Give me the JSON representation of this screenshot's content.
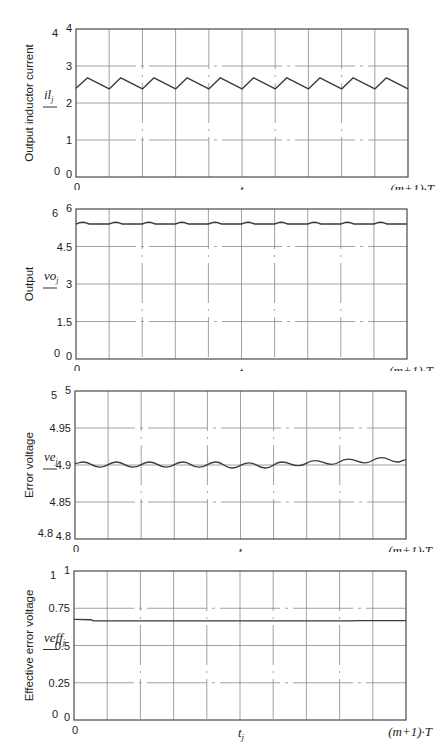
{
  "chart_data": [
    {
      "type": "line",
      "title": "",
      "ylabel": "Output inductor current",
      "var_label": "il_j",
      "var_base": "il",
      "var_sub": "j",
      "xlabel": "t_j",
      "x_ticks": [
        "0",
        "(m+1)·T"
      ],
      "x_divisions": 10,
      "ylim": [
        0,
        4
      ],
      "y_ticks": [
        0,
        1,
        2,
        3,
        4
      ],
      "y_tick_labels": [
        "0",
        "1",
        "2",
        "3",
        "4"
      ],
      "outer_labels": {
        "top": "4",
        "bottom": "0"
      },
      "grid": true,
      "series": [
        {
          "name": "il_j",
          "x": [
            0,
            0.35,
            1,
            1.35,
            2,
            2.35,
            3,
            3.35,
            4,
            4.35,
            5,
            5.35,
            6,
            6.35,
            7,
            7.35,
            8,
            8.35,
            9,
            9.35,
            10
          ],
          "values": [
            2.4,
            2.68,
            2.38,
            2.68,
            2.38,
            2.68,
            2.38,
            2.68,
            2.38,
            2.68,
            2.38,
            2.68,
            2.38,
            2.68,
            2.38,
            2.68,
            2.38,
            2.68,
            2.38,
            2.68,
            2.38
          ]
        }
      ]
    },
    {
      "type": "line",
      "title": "",
      "ylabel": "Output",
      "var_label": "vo_j",
      "var_base": "vo",
      "var_sub": "j",
      "xlabel": "t_j",
      "x_ticks": [
        "0",
        "(m+1)·T"
      ],
      "x_divisions": 10,
      "ylim": [
        0,
        6
      ],
      "y_ticks": [
        0,
        1.5,
        3,
        4.5,
        6
      ],
      "y_tick_labels": [
        "0",
        "1.5",
        "3",
        "4.5",
        "6"
      ],
      "outer_labels": {
        "top": "6",
        "bottom": "0"
      },
      "grid": true,
      "series": [
        {
          "name": "vo_j",
          "x": [
            0,
            0.1,
            0.2,
            0.3,
            0.4,
            1,
            1.1,
            1.2,
            1.3,
            1.4,
            2,
            2.1,
            2.2,
            2.3,
            2.4,
            3,
            3.1,
            3.2,
            3.3,
            3.4,
            4,
            4.1,
            4.2,
            4.3,
            4.4,
            5,
            5.1,
            5.2,
            5.3,
            5.4,
            6,
            6.1,
            6.2,
            6.3,
            6.4,
            7,
            7.1,
            7.2,
            7.3,
            7.4,
            8,
            8.1,
            8.2,
            8.3,
            8.4,
            9,
            9.1,
            9.2,
            9.3,
            9.4,
            10
          ],
          "values": [
            5.4,
            5.45,
            5.47,
            5.45,
            5.4,
            5.4,
            5.45,
            5.47,
            5.45,
            5.4,
            5.4,
            5.45,
            5.47,
            5.45,
            5.4,
            5.4,
            5.45,
            5.47,
            5.45,
            5.4,
            5.4,
            5.45,
            5.47,
            5.45,
            5.4,
            5.4,
            5.45,
            5.47,
            5.45,
            5.4,
            5.4,
            5.45,
            5.47,
            5.45,
            5.4,
            5.4,
            5.45,
            5.47,
            5.45,
            5.4,
            5.4,
            5.45,
            5.47,
            5.45,
            5.4,
            5.4,
            5.45,
            5.47,
            5.45,
            5.4,
            5.4
          ]
        }
      ]
    },
    {
      "type": "line",
      "title": "",
      "ylabel": "Error voltage",
      "var_label": "ve_j",
      "var_base": "ve",
      "var_sub": "j",
      "xlabel": "t_j",
      "x_ticks": [
        "0",
        "(m+1)·T"
      ],
      "x_divisions": 10,
      "ylim": [
        4.8,
        5.0
      ],
      "y_ticks": [
        4.8,
        4.85,
        4.9,
        4.95,
        5.0
      ],
      "y_tick_labels": [
        "4.8",
        "4.85",
        "4.9",
        "4.95",
        "5"
      ],
      "outer_labels": {
        "top": "5",
        "bottom": "4.8"
      },
      "grid": true,
      "series": [
        {
          "name": "ve_j",
          "x": [
            0,
            0.25,
            0.75,
            1.25,
            1.75,
            2.25,
            2.75,
            3.25,
            3.75,
            4.25,
            4.75,
            5.25,
            5.75,
            6.25,
            6.75,
            7.25,
            7.75,
            8.25,
            8.75,
            9.25,
            9.75,
            10
          ],
          "values": [
            4.902,
            4.904,
            4.897,
            4.904,
            4.897,
            4.904,
            4.897,
            4.904,
            4.897,
            4.904,
            4.896,
            4.903,
            4.896,
            4.904,
            4.899,
            4.906,
            4.901,
            4.908,
            4.903,
            4.91,
            4.904,
            4.907
          ]
        }
      ]
    },
    {
      "type": "line",
      "title": "",
      "ylabel": "Effective error voltage",
      "var_label": "veff_j",
      "var_base": "veff",
      "var_sub": "j",
      "xlabel": "t_j",
      "x_ticks": [
        "0",
        "(m+1)·T"
      ],
      "x_divisions": 10,
      "ylim": [
        0,
        1
      ],
      "y_ticks": [
        0,
        0.25,
        0.5,
        0.75,
        1
      ],
      "y_tick_labels": [
        "0",
        "0.25",
        "0.5",
        "0.75",
        "1"
      ],
      "outer_labels": {
        "top": "1",
        "bottom": "0"
      },
      "grid": true,
      "series": [
        {
          "name": "veff_j",
          "x": [
            0,
            0.5,
            0.6,
            8.4,
            8.5,
            10
          ],
          "values": [
            0.675,
            0.673,
            0.665,
            0.665,
            0.667,
            0.667
          ]
        }
      ]
    }
  ],
  "panels": [
    {
      "top": 0,
      "height": 190
    },
    {
      "top": 181,
      "height": 190
    },
    {
      "top": 362,
      "height": 190
    },
    {
      "top": 543,
      "height": 213
    }
  ],
  "colors": {
    "line": "#3a3a3a",
    "grid": "#8a8a8a",
    "frame": "#4a4a4a",
    "text": "#222222"
  }
}
